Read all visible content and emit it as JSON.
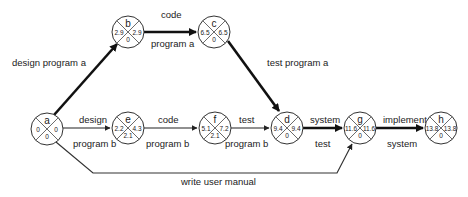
{
  "diagram": {
    "type": "activity-on-arrow network",
    "nodes": [
      {
        "id": "a",
        "x": 47,
        "y": 129,
        "left": "0",
        "right": "0",
        "bottom": "0"
      },
      {
        "id": "b",
        "x": 128,
        "y": 32,
        "left": "2.9",
        "right": "2.9",
        "bottom": "0"
      },
      {
        "id": "c",
        "x": 214,
        "y": 32,
        "left": "6.5",
        "right": "6.5",
        "bottom": "0"
      },
      {
        "id": "e",
        "x": 128,
        "y": 128,
        "left": "2.2",
        "right": "4.3",
        "bottom": "2.1"
      },
      {
        "id": "f",
        "x": 215,
        "y": 128,
        "left": "5.1",
        "right": "7.2",
        "bottom": "2.1"
      },
      {
        "id": "d",
        "x": 287,
        "y": 128,
        "left": "9.4",
        "right": "9.4",
        "bottom": "0"
      },
      {
        "id": "g",
        "x": 360,
        "y": 128,
        "left": "11.6",
        "right": "11.6",
        "bottom": "0"
      },
      {
        "id": "h",
        "x": 441,
        "y": 128,
        "left": "13.8",
        "right": "13.8",
        "bottom": "0"
      }
    ],
    "edges": [
      {
        "from": "a",
        "to": "b",
        "label_top": "design program a",
        "label_bottom": "",
        "critical": true
      },
      {
        "from": "b",
        "to": "c",
        "label_top": "code",
        "label_bottom": "program a",
        "critical": true
      },
      {
        "from": "c",
        "to": "d",
        "label_top": "test program a",
        "label_bottom": "",
        "critical": true
      },
      {
        "from": "a",
        "to": "e",
        "label_top": "design",
        "label_bottom": "program b",
        "critical": false
      },
      {
        "from": "e",
        "to": "f",
        "label_top": "code",
        "label_bottom": "program b",
        "critical": false
      },
      {
        "from": "f",
        "to": "d",
        "label_top": "test",
        "label_bottom": "program b",
        "critical": false
      },
      {
        "from": "d",
        "to": "g",
        "label_top": "system",
        "label_bottom": "test",
        "critical": true
      },
      {
        "from": "g",
        "to": "h",
        "label_top": "implement",
        "label_bottom": "system",
        "critical": true
      },
      {
        "from": "a",
        "to": "g",
        "label_top": "",
        "label_bottom": "write user manual",
        "critical": false
      }
    ]
  }
}
